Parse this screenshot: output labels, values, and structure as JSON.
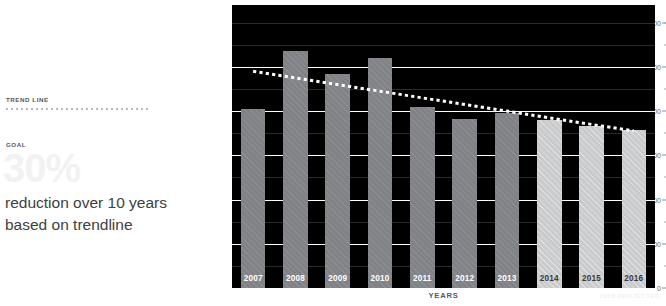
{
  "annotations": {
    "trend_line_label": "TREND LINE",
    "goal_label": "GOAL",
    "goal_number": "30%",
    "goal_description": "reduction over 10 years based on trendline"
  },
  "footnote": {
    "projected_note": "2016 PROJECTED"
  },
  "colors": {
    "bar_actual": "#808285",
    "bar_projected": "#c9cbcd",
    "plot_background": "#000000",
    "gridline": "#ffffff",
    "trendline": "#ffffff",
    "text_dark": "#414042",
    "text_muted": "#58585a",
    "goal_number_color": "#f2f2f2"
  },
  "chart_data": {
    "type": "bar",
    "title": "",
    "xlabel": "YEARS",
    "ylabel": "TONNES CO2e",
    "ylabel_html": "TONNES CO<sub>2</sub>e",
    "categories": [
      "2007",
      "2008",
      "2009",
      "2010",
      "2011",
      "2012",
      "2013",
      "2014",
      "2015",
      "2016"
    ],
    "values": [
      8100,
      10700,
      9700,
      10400,
      8200,
      7650,
      7900,
      7600,
      7350,
      7150
    ],
    "projected_from": "2014",
    "projected_categories": [
      "2014",
      "2015",
      "2016"
    ],
    "ylim": [
      0,
      12800
    ],
    "yticks": [
      0,
      2000,
      4000,
      6000,
      8000,
      10000,
      12000
    ],
    "ytick_labels": [
      "0",
      "2,000",
      "4,000",
      "6,000",
      "8,000",
      "10,000",
      "12,000"
    ],
    "yticks_minor": [
      1000,
      3000,
      5000,
      7000,
      9000,
      11000,
      12000
    ],
    "grid": true,
    "legend_position": "left-panel",
    "series": [
      {
        "name": "Emissions",
        "values": [
          8100,
          10700,
          9700,
          10400,
          8200,
          7650,
          7900,
          7600,
          7350,
          7150
        ]
      },
      {
        "name": "TREND LINE",
        "type": "line",
        "style": "dotted",
        "values": [
          9800,
          9500,
          9200,
          8900,
          8600,
          8300,
          8000,
          7700,
          7400,
          7100
        ]
      }
    ],
    "annotations": [
      {
        "text": "30% reduction over 10 years based on trendline",
        "target": "trendline"
      }
    ]
  }
}
